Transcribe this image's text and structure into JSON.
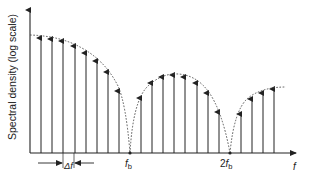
{
  "diagram": {
    "y_axis_label": "Spectral density (log scale)",
    "x_axis_label": "f",
    "tick_labels": {
      "fb_main": "f",
      "fb_sub": "b",
      "two_fb_prefix": "2",
      "two_fb_main": "f",
      "two_fb_sub": "b"
    },
    "spacing_label": "Δf",
    "colors": {
      "line": "#222222",
      "envelope": "#444444",
      "background": "#ffffff"
    },
    "lobes": [
      {
        "name": "main-lobe",
        "arrows_x": [
          41,
          52,
          63,
          75,
          86,
          97,
          108,
          119
        ],
        "tips_y": [
          37,
          38,
          40,
          45,
          52,
          60,
          71,
          90
        ]
      },
      {
        "name": "second-lobe",
        "arrows_x": [
          141,
          152,
          163,
          174,
          185,
          197,
          208,
          219
        ],
        "tips_y": [
          97,
          82,
          76,
          74,
          76,
          82,
          92,
          111
        ]
      },
      {
        "name": "third-lobe",
        "arrows_x": [
          241,
          252,
          263,
          274
        ],
        "tips_y": [
          113,
          98,
          92,
          88
        ]
      }
    ],
    "nulls": [
      "f_b",
      "2f_b"
    ]
  }
}
